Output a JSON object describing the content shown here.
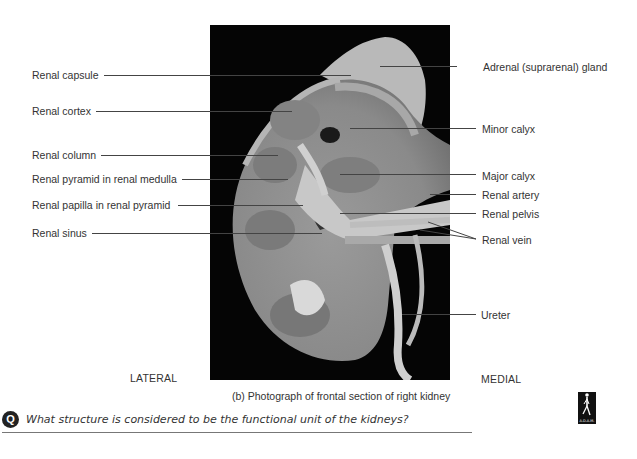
{
  "figure": {
    "caption": "(b) Photograph of frontal section of right kidney",
    "orientation": {
      "left": "LATERAL",
      "right": "MEDIAL"
    },
    "labels_left": [
      {
        "text": "Renal capsule",
        "y": 75
      },
      {
        "text": "Renal cortex",
        "y": 111
      },
      {
        "text": "Renal column",
        "y": 155
      },
      {
        "text": "Renal pyramid in renal medulla",
        "y": 179
      },
      {
        "text": "Renal papilla in renal pyramid",
        "y": 205
      },
      {
        "text": "Renal sinus",
        "y": 233
      }
    ],
    "labels_right": [
      {
        "text": "Adrenal (suprarenal) gland",
        "y": 68
      },
      {
        "text": "Minor calyx",
        "y": 130
      },
      {
        "text": "Major calyx",
        "y": 176
      },
      {
        "text": "Renal artery",
        "y": 195
      },
      {
        "text": "Renal pelvis",
        "y": 214
      },
      {
        "text": "Renal vein",
        "y": 241
      },
      {
        "text": "Ureter",
        "y": 315
      }
    ],
    "logo": {
      "name": "A.D.A.M."
    }
  },
  "question": {
    "icon": "Q",
    "text": "What structure is considered to be the functional unit of the kidneys?"
  }
}
